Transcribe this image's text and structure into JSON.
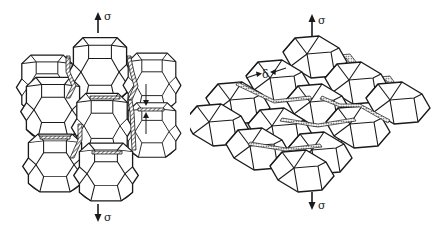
{
  "figure": {
    "left_panel": {
      "description": "packing of truncated octahedra (tetrakaidecahedral grains) with hatched grain-boundary layers",
      "stress_top_label": "σ",
      "stress_bottom_label": "σ"
    },
    "right_panel": {
      "description": "packing of rhombic dodecahedral grains with dotted grain-boundary layers",
      "thickness_label": "δ",
      "stress_top_label": "σ",
      "stress_bottom_label": "σ"
    }
  },
  "colors": {
    "line": "#1a1a1a",
    "background": "#ffffff"
  }
}
